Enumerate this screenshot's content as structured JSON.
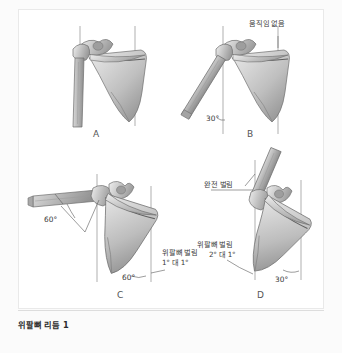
{
  "figure": {
    "caption": "위팔뼈 리듬 1",
    "panels": [
      {
        "id": "A",
        "letter": "A",
        "labels": [],
        "angles": [],
        "description": "anatomical-neutral-scapula-humerus"
      },
      {
        "id": "B",
        "letter": "B",
        "labels": [
          "움직임 없음"
        ],
        "angles": [
          "30°"
        ],
        "description": "humerus-abducted-scapula-static"
      },
      {
        "id": "C",
        "letter": "C",
        "labels": [
          "위팔뼈 벌림",
          "1° 대 1°"
        ],
        "angles": [
          "60°",
          "60°"
        ],
        "description": "humerus-and-scapula-rotation-one-to-one"
      },
      {
        "id": "D",
        "letter": "D",
        "labels": [
          "완전 벌림",
          "위팔뼈 벌림",
          "2° 대 1°"
        ],
        "angles": [
          "30°"
        ],
        "description": "full-abduction-two-to-one-rhythm"
      }
    ]
  },
  "panel_a": {
    "letter": "A"
  },
  "panel_b": {
    "letter": "B",
    "no_motion_label": "움직임 없음",
    "angle_30": "30°"
  },
  "panel_c": {
    "letter": "C",
    "angle_humerus": "60°",
    "angle_scapula": "60°",
    "rhythm_label_line1": "위팔뼈 벌림",
    "rhythm_label_line2": "1° 대 1°"
  },
  "panel_d": {
    "letter": "D",
    "full_abduction_label": "완전 벌림",
    "rhythm_label_line1": "위팔뼈 벌림",
    "rhythm_label_line2": "2° 대 1°",
    "angle_scapula": "30°"
  },
  "colors": {
    "page_background": "#fbfbfb",
    "card_background": "#ffffff",
    "bone_light": "#e2e2e2",
    "bone_mid": "#b9b9b9",
    "bone_dark": "#8a8a8a",
    "outline": "#6f6f6f",
    "reference_line": "#8e8e8e",
    "text": "#3a3a3a",
    "caption_text": "#2b2b2b"
  }
}
